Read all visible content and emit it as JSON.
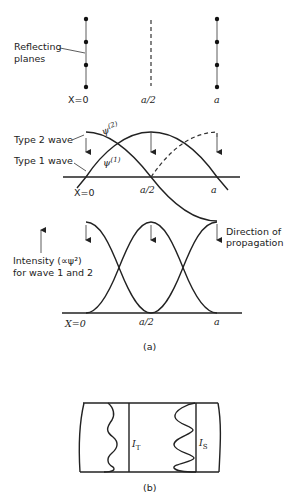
{
  "panel_a": {
    "planes": {
      "label_line1": "Reflecting",
      "label_line2": "planes",
      "x0_label": "X=0",
      "mid_label": "a/2",
      "end_label": "a"
    },
    "waves": {
      "type2_label": "Type 2 wave",
      "type1_label": "Type 1 wave",
      "psi2_label": "ψ",
      "psi2_sup": "(2)",
      "psi1_label": "ψ",
      "psi1_sup": "(1)",
      "x0_label": "X=0",
      "mid_label": "a/2",
      "end_label": "a",
      "direction_line1": "Direction of",
      "direction_line2": "propagation"
    },
    "intensity": {
      "label_line1": "Intensity (∝ψ²)",
      "label_line2": "for wave   1 and 2",
      "x0_label": "X=0",
      "mid_label": "a/2",
      "end_label": "a"
    },
    "caption": "(a)"
  },
  "panel_b": {
    "it_label": "I",
    "it_sub": "T",
    "is_label": "I",
    "is_sub": "S",
    "caption": "(b)"
  }
}
